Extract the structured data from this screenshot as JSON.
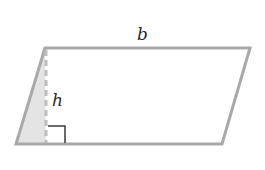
{
  "diagram": {
    "type": "parallelogram",
    "labels": {
      "base": "b",
      "height": "h"
    },
    "colors": {
      "outline": "#a9a9a9",
      "shaded_triangle": "#e4e4e4",
      "right_angle_marker": "#3a3a3a",
      "label": "#2a2a2a"
    }
  }
}
